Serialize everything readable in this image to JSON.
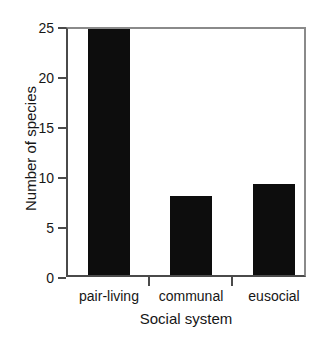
{
  "chart_data": {
    "type": "bar",
    "title": "",
    "categories": [
      "pair-living",
      "communal",
      "eusocial"
    ],
    "values": [
      25,
      8,
      9.2
    ],
    "xlabel": "Social system",
    "ylabel": "Number of species",
    "ylim": [
      0,
      25
    ],
    "yticks": [
      0,
      5,
      10,
      15,
      20,
      25
    ],
    "ytick_labels": [
      "0",
      "5",
      "10",
      "15",
      "20",
      "25"
    ],
    "grid": false,
    "legend": null,
    "bar_color": "#0d0d0d",
    "axis_color": "#4a4a4a",
    "background": "#ffffff"
  },
  "axes": {
    "y_title": "Number of species",
    "x_title": "Social system",
    "y_ticks": [
      {
        "value": "25"
      },
      {
        "value": "20"
      },
      {
        "value": "15"
      },
      {
        "value": "10"
      },
      {
        "value": "5"
      },
      {
        "value": "0"
      }
    ],
    "x_categories": [
      {
        "label": "pair-living"
      },
      {
        "label": "communal"
      },
      {
        "label": "eusocial"
      }
    ]
  }
}
